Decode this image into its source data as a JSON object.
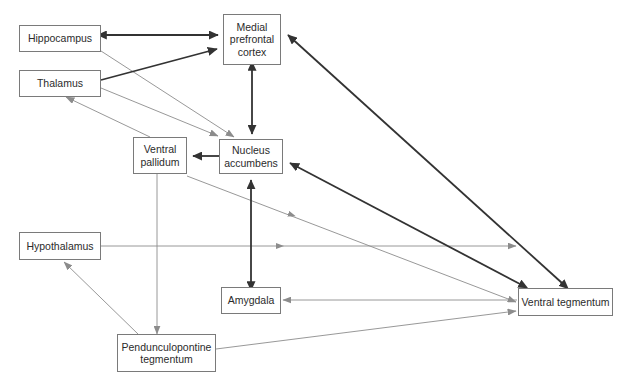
{
  "diagram": {
    "type": "node-edge-diagram",
    "width": 627,
    "height": 381,
    "background_color": "#ffffff",
    "box_border_color": "#7a7a7a",
    "text_color": "#2b2b2b",
    "thin_edge_color": "#8c8c8c",
    "thick_edge_color": "#333333"
  },
  "nodes": [
    {
      "id": "hippocampus",
      "label": "Hippocampus",
      "x": 19,
      "y": 25,
      "w": 82,
      "h": 27
    },
    {
      "id": "thalamus",
      "label": "Thalamus",
      "x": 19,
      "y": 70,
      "w": 82,
      "h": 27
    },
    {
      "id": "mpfc",
      "label": "Medial\nprefrontal\ncortex",
      "x": 223,
      "y": 14,
      "w": 58,
      "h": 51
    },
    {
      "id": "ventral_pallidum",
      "label": "Ventral\npallidum",
      "x": 133,
      "y": 137,
      "w": 54,
      "h": 37
    },
    {
      "id": "nucleus_accumbens",
      "label": "Nucleus\naccumbens",
      "x": 219,
      "y": 139,
      "w": 64,
      "h": 35
    },
    {
      "id": "hypothalamus",
      "label": "Hypothalamus",
      "x": 19,
      "y": 232,
      "w": 82,
      "h": 28
    },
    {
      "id": "amygdala",
      "label": "Amygdala",
      "x": 221,
      "y": 287,
      "w": 60,
      "h": 27
    },
    {
      "id": "ppt",
      "label": "Pendunculopontine\ntegmentum",
      "x": 117,
      "y": 334,
      "w": 99,
      "h": 38
    },
    {
      "id": "vta",
      "label": "Ventral tegmentum",
      "x": 518,
      "y": 288,
      "w": 95,
      "h": 28
    }
  ],
  "edges": [
    {
      "id": "hippocampus-mpfc",
      "from": "hippocampus",
      "to": "mpfc",
      "weight": "thick",
      "arrows": "both"
    },
    {
      "id": "thalamus-mpfc",
      "from": "thalamus",
      "to": "mpfc",
      "weight": "thick",
      "arrows": "end"
    },
    {
      "id": "hippocampus-nacc",
      "from": "hippocampus",
      "to": "nucleus_accumbens",
      "weight": "thin",
      "arrows": "end"
    },
    {
      "id": "thalamus-nacc",
      "from": "thalamus",
      "to": "nucleus_accumbens",
      "weight": "thin",
      "arrows": "end"
    },
    {
      "id": "mpfc-nacc",
      "from": "mpfc",
      "to": "nucleus_accumbens",
      "weight": "thick",
      "arrows": "both"
    },
    {
      "id": "nacc-ventral-pallidum",
      "from": "nucleus_accumbens",
      "to": "ventral_pallidum",
      "weight": "thick",
      "arrows": "end"
    },
    {
      "id": "ventral-pallidum-thalamus",
      "from": "ventral_pallidum",
      "to": "thalamus",
      "weight": "thin",
      "arrows": "end"
    },
    {
      "id": "ventral-pallidum-ppt",
      "from": "ventral_pallidum",
      "to": "ppt",
      "weight": "thin",
      "arrows": "end"
    },
    {
      "id": "ventral-pallidum-vta",
      "from": "ventral_pallidum",
      "to": "vta",
      "weight": "thin",
      "arrows": "end"
    },
    {
      "id": "amygdala-nacc",
      "from": "amygdala",
      "to": "nucleus_accumbens",
      "weight": "thick",
      "arrows": "both"
    },
    {
      "id": "vta-nacc",
      "from": "vta",
      "to": "nucleus_accumbens",
      "weight": "thick",
      "arrows": "both"
    },
    {
      "id": "vta-mpfc",
      "from": "vta",
      "to": "mpfc",
      "weight": "thick",
      "arrows": "both"
    },
    {
      "id": "vta-amygdala",
      "from": "vta",
      "to": "amygdala",
      "weight": "thin",
      "arrows": "end"
    },
    {
      "id": "hypothalamus-vta",
      "from": "hypothalamus",
      "to": "vta",
      "weight": "thin",
      "arrows": "end"
    },
    {
      "id": "ppt-vta",
      "from": "ppt",
      "to": "vta",
      "weight": "thin",
      "arrows": "end"
    },
    {
      "id": "ppt-hypothalamus",
      "from": "ppt",
      "to": "hypothalamus",
      "weight": "thin",
      "arrows": "end"
    }
  ]
}
